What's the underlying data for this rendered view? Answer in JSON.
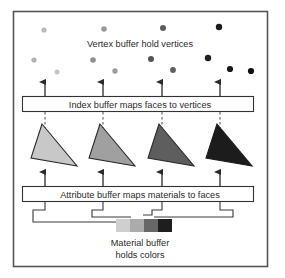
{
  "figure": {
    "frame": {
      "x": 13,
      "y": 11,
      "width": 255,
      "height": 256,
      "border_color": "#55555a",
      "background": "#ffffff"
    },
    "vertex_section": {
      "label": "Vertex buffer hold vertices",
      "label_x": 140,
      "label_y": 44,
      "dots": [
        {
          "cx": 44,
          "cy": 30,
          "r": 2.6,
          "color": "#b9b9b9"
        },
        {
          "cx": 104,
          "cy": 29,
          "r": 2.8,
          "color": "#9a9a9a"
        },
        {
          "cx": 163,
          "cy": 28,
          "r": 3.0,
          "color": "#5d5d5d"
        },
        {
          "cx": 219,
          "cy": 27,
          "r": 3.2,
          "color": "#1b1b1b"
        },
        {
          "cx": 34,
          "cy": 60,
          "r": 2.6,
          "color": "#b0b0b0"
        },
        {
          "cx": 93,
          "cy": 60,
          "r": 2.8,
          "color": "#8f8f8f"
        },
        {
          "cx": 151,
          "cy": 59,
          "r": 3.0,
          "color": "#555555"
        },
        {
          "cx": 208,
          "cy": 58,
          "r": 3.2,
          "color": "#1f1f1f"
        },
        {
          "cx": 57,
          "cy": 72,
          "r": 2.5,
          "color": "#c5c5c5"
        },
        {
          "cx": 115,
          "cy": 71,
          "r": 2.7,
          "color": "#9d9d9d"
        },
        {
          "cx": 173,
          "cy": 70,
          "r": 2.9,
          "color": "#606060"
        },
        {
          "cx": 230,
          "cy": 69,
          "r": 3.1,
          "color": "#1a1a1a"
        },
        {
          "cx": 251,
          "cy": 71,
          "r": 3.1,
          "color": "#111111"
        }
      ]
    },
    "index_buffer": {
      "label": "Index buffer maps faces to vertices",
      "box": {
        "x": 22,
        "y": 96,
        "width": 232,
        "height": 16
      },
      "label_x": 140,
      "label_y": 107,
      "arrows_up": [
        {
          "x": 45,
          "y_top": 82,
          "y_bottom": 96
        },
        {
          "x": 103,
          "y_top": 82,
          "y_bottom": 96
        },
        {
          "x": 162,
          "y_top": 82,
          "y_bottom": 96
        },
        {
          "x": 220,
          "y_top": 82,
          "y_bottom": 96
        }
      ],
      "dashed_down": [
        {
          "x": 45,
          "y_top": 112,
          "y_bottom": 127
        },
        {
          "x": 103,
          "y_top": 112,
          "y_bottom": 127
        },
        {
          "x": 162,
          "y_top": 112,
          "y_bottom": 127
        },
        {
          "x": 220,
          "y_top": 112,
          "y_bottom": 127
        }
      ]
    },
    "faces": {
      "triangles": [
        {
          "name": "face-1",
          "points": "42,124 31,158 77,166",
          "fill": "#c8c8c8",
          "stroke": "#2a2a2a"
        },
        {
          "name": "face-2",
          "points": "100,124 89,158 135,166",
          "fill": "#a0a0a0",
          "stroke": "#2a2a2a"
        },
        {
          "name": "face-3",
          "points": "159,124 148,158 194,166",
          "fill": "#5e5e5e",
          "stroke": "#2a2a2a"
        },
        {
          "name": "face-4",
          "points": "217,124 206,158 252,166",
          "fill": "#1c1c1c",
          "stroke": "#1c1c1c"
        }
      ]
    },
    "attribute_buffer": {
      "label": "Attribute buffer maps materials to faces",
      "box": {
        "x": 22,
        "y": 186,
        "width": 232,
        "height": 16
      },
      "label_x": 140,
      "label_y": 197,
      "arrows_up": [
        {
          "x": 45,
          "y_top": 172,
          "y_bottom": 186
        },
        {
          "x": 103,
          "y_top": 172,
          "y_bottom": 186
        },
        {
          "x": 162,
          "y_top": 172,
          "y_bottom": 186
        },
        {
          "x": 220,
          "y_top": 172,
          "y_bottom": 186
        }
      ],
      "connectors": [
        "M45,202 L45,210 L33,210 L33,222 L122,222",
        "M103,202 L103,210 L93,210 L93,217 L129,217",
        "M162,202 L162,210 L152,210 L152,214 L141,214",
        "M220,202 L220,210 L232,210 L232,217 L152,217"
      ]
    },
    "material_buffer": {
      "caption_line1": "Material buffer",
      "caption_line2": "holds colors",
      "caption_x": 140,
      "caption_y1": 244,
      "caption_y2": 256,
      "strip": {
        "x": 116,
        "y": 219,
        "width": 56,
        "height": 13
      },
      "swatches": [
        {
          "name": "material-swatch-1",
          "x": 116,
          "width": 14,
          "color": "#cfcfcf"
        },
        {
          "name": "material-swatch-2",
          "x": 130,
          "width": 14,
          "color": "#ababab"
        },
        {
          "name": "material-swatch-3",
          "x": 144,
          "width": 14,
          "color": "#676767"
        },
        {
          "name": "material-swatch-4",
          "x": 158,
          "width": 14,
          "color": "#1e1e1e"
        }
      ]
    },
    "colors": {
      "line": "#3a3a3a",
      "text": "#2b2b2b",
      "box_border": "#333333",
      "frame_border": "#55555a"
    }
  }
}
